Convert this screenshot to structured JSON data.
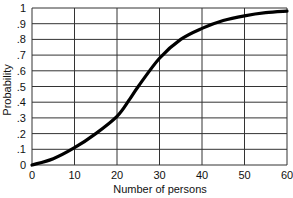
{
  "chart_data": {
    "type": "line",
    "title": "",
    "xlabel": "Number of persons",
    "ylabel": "Probability",
    "xlim": [
      0,
      60
    ],
    "ylim": [
      0,
      1
    ],
    "grid": true,
    "legend": null,
    "x_ticks": [
      "0",
      "10",
      "20",
      "30",
      "40",
      "50",
      "60"
    ],
    "y_ticks": [
      "0",
      ".1",
      ".2",
      ".3",
      ".4",
      ".5",
      ".6",
      ".7",
      ".8",
      ".9",
      "1"
    ],
    "series": [
      {
        "name": "Probability",
        "x": [
          0,
          5,
          10,
          15,
          20,
          23,
          25,
          30,
          35,
          40,
          45,
          50,
          55,
          60
        ],
        "values": [
          0.0,
          0.04,
          0.11,
          0.2,
          0.31,
          0.42,
          0.5,
          0.68,
          0.8,
          0.87,
          0.92,
          0.95,
          0.97,
          0.98
        ]
      }
    ]
  }
}
